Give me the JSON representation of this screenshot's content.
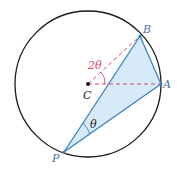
{
  "diagram": {
    "labels": {
      "B": "B",
      "A": "A",
      "C": "C",
      "P": "P",
      "central_angle": "2θ",
      "inscribed_angle": "θ"
    },
    "colors": {
      "circle": "#1a1a1a",
      "lines": "#3b7fc4",
      "fill": "#d6eaf8",
      "dashed": "#d9456e",
      "angle_label": "#d9456e",
      "text": "#4a6fa5"
    }
  }
}
